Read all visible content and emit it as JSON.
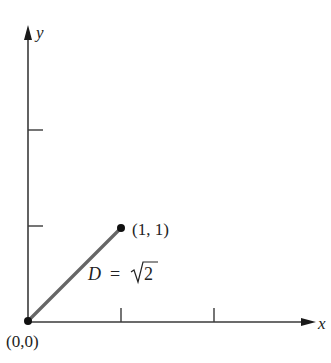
{
  "diagram": {
    "type": "coordinate-plane-distance",
    "colors": {
      "axis": "#3a3a3a",
      "segment": "#666666",
      "point": "#111111",
      "text": "#222222",
      "background": "#ffffff"
    },
    "axes": {
      "x_label": "x",
      "y_label": "y",
      "x_ticks": [
        1,
        2
      ],
      "y_ticks": [
        1,
        2
      ]
    },
    "points": [
      {
        "name": "origin",
        "label": "(0,0)",
        "x": 0,
        "y": 0
      },
      {
        "name": "point-1-1",
        "label": "(1, 1)",
        "x": 1,
        "y": 1
      }
    ],
    "segment": {
      "from": "origin",
      "to": "point-1-1",
      "label_var": "D",
      "label_eq": "=",
      "label_value": "2",
      "label_full": "D = √2"
    }
  }
}
